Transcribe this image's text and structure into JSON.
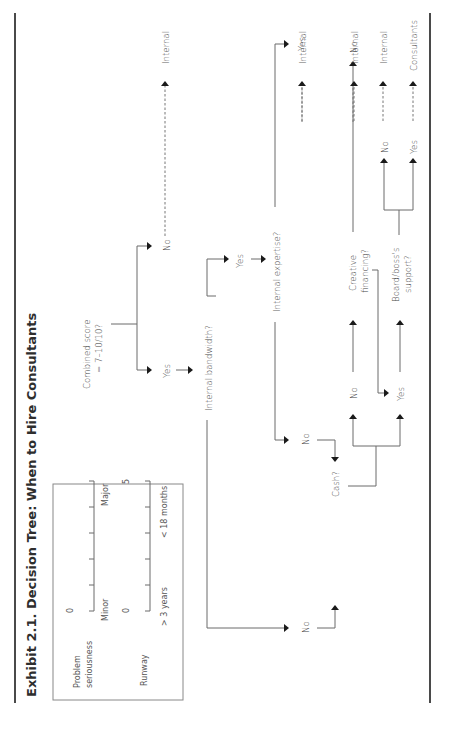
{
  "title": "Exhibit 2.1. Decision Tree: When to Hire Consultants",
  "orientation": "rotated 90° counter-clockwise",
  "legend": {
    "scales": [
      {
        "label_line1": "Problem",
        "label_line2": "seriousness",
        "min_value": "0",
        "max_value": "5",
        "min_label": "Minor",
        "max_label": "Major",
        "ticks": 6
      },
      {
        "label_line1": "Runway",
        "label_line2": "",
        "min_value": "0",
        "max_value": "5",
        "min_label": "> 3 years",
        "max_label": "< 18 months",
        "ticks": 6
      }
    ]
  },
  "nodes": {
    "combined_score": {
      "line1": "Combined score",
      "line2": "= 7–10/10?"
    },
    "internal_bandwidth": {
      "label": "Internal bandwidth?"
    },
    "internal_expertise": {
      "label": "Internal expertise?"
    },
    "cash": {
      "label": "Cash?"
    },
    "creative_financing": {
      "line1": "Creative",
      "line2": "financing?"
    },
    "board_support": {
      "line1": "Board/boss's",
      "line2": "support?"
    }
  },
  "branches": {
    "combined_yes": "Yes",
    "combined_no": "No",
    "bandwidth_yes": "Yes",
    "bandwidth_no": "No",
    "expertise_yes": "Yes",
    "expertise_no": "No",
    "cash_no": "No",
    "cash_yes": "Yes",
    "creative_no": "No",
    "board_no": "No",
    "board_yes": "Yes"
  },
  "outcomes": {
    "combined_no": "Internal",
    "expertise_yes": "Internal",
    "creative_no": "Internal",
    "board_no": "Internal",
    "board_yes": "Consultants"
  }
}
